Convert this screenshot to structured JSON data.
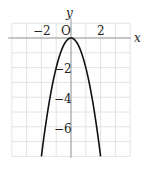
{
  "chart_data": {
    "type": "line",
    "title": "",
    "function": "y = -2x^2",
    "xlabel": "x",
    "ylabel": "y",
    "origin_label": "O",
    "xlim": [
      -4,
      4
    ],
    "ylim": [
      -8,
      1
    ],
    "grid": true,
    "grid_step": 1,
    "x_ticks": [
      {
        "value": -2,
        "label": "−2"
      },
      {
        "value": 2,
        "label": "2"
      }
    ],
    "y_ticks": [
      {
        "value": -2,
        "label": "−2"
      },
      {
        "value": -4,
        "label": "−4"
      },
      {
        "value": -6,
        "label": "−6"
      }
    ],
    "series": [
      {
        "name": "parabola",
        "x": [
          -2,
          -1.5,
          -1,
          -0.5,
          0,
          0.5,
          1,
          1.5,
          2
        ],
        "values": [
          -8,
          -4.5,
          -2,
          -0.5,
          0,
          -0.5,
          -2,
          -4.5,
          -8
        ]
      }
    ],
    "colors": {
      "grid": "#e4e4e4",
      "axis": "#9a9a9a",
      "curve": "#111111",
      "text": "#222222"
    }
  },
  "labels": {
    "x_axis": "x",
    "y_axis": "y",
    "origin": "O",
    "x_tick_neg2": "−2",
    "x_tick_2": "2",
    "y_tick_neg2": "−2",
    "y_tick_neg4": "−4",
    "y_tick_neg6": "−6"
  }
}
